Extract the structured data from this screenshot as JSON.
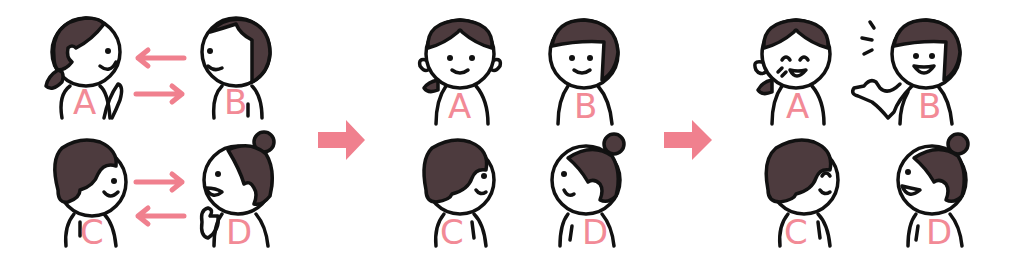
{
  "illustration": {
    "panels": [
      {
        "id": "panel-1",
        "description": "Pairs talking to each other",
        "characters": [
          {
            "label": "A",
            "expression": "talking",
            "facing": "right"
          },
          {
            "label": "B",
            "expression": "smiling",
            "facing": "left"
          },
          {
            "label": "C",
            "expression": "smiling",
            "facing": "right"
          },
          {
            "label": "D",
            "expression": "talking",
            "facing": "left"
          }
        ],
        "arrows": [
          {
            "from": "B",
            "to": "A"
          },
          {
            "from": "A",
            "to": "B"
          },
          {
            "from": "C",
            "to": "D"
          },
          {
            "from": "D",
            "to": "C"
          }
        ]
      },
      {
        "id": "panel-2",
        "description": "A and B face front; C and D turned away",
        "characters": [
          {
            "label": "A",
            "expression": "smiling",
            "facing": "front"
          },
          {
            "label": "B",
            "expression": "smiling",
            "facing": "front"
          },
          {
            "label": "C",
            "expression": "smiling",
            "facing": "right"
          },
          {
            "label": "D",
            "expression": "mouth-open",
            "facing": "left"
          }
        ]
      },
      {
        "id": "panel-3",
        "description": "A laughs while B gestures; C and D chat",
        "characters": [
          {
            "label": "A",
            "expression": "laughing",
            "facing": "front"
          },
          {
            "label": "B",
            "expression": "talking-gesturing",
            "facing": "front"
          },
          {
            "label": "C",
            "expression": "happy",
            "facing": "right"
          },
          {
            "label": "D",
            "expression": "talking",
            "facing": "left"
          }
        ]
      }
    ],
    "transition_arrows": 2,
    "colors": {
      "accent_pink": "#f0808e",
      "hair": "#4d3b3e",
      "outline": "#111111",
      "background": "#ffffff"
    }
  },
  "labels": {
    "p1a": "A",
    "p1b": "B",
    "p1c": "C",
    "p1d": "D",
    "p2a": "A",
    "p2b": "B",
    "p2c": "C",
    "p2d": "D",
    "p3a": "A",
    "p3b": "B",
    "p3c": "C",
    "p3d": "D"
  }
}
